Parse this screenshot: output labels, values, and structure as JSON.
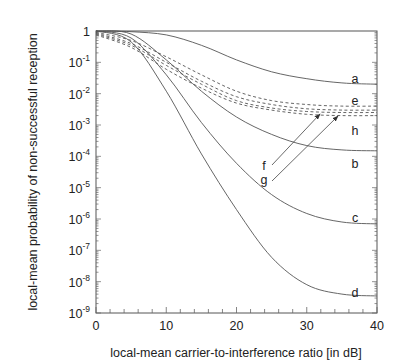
{
  "chart_data": {
    "type": "line",
    "title": "",
    "xlabel": "local-mean carrier-to-interference ratio [in dB]",
    "ylabel": "local-mean probability of non-successful reception",
    "xlim": [
      0,
      40
    ],
    "ylim": [
      1e-09,
      1
    ],
    "yscale": "log",
    "grid": false,
    "legend": "inline curve labels at right",
    "x_ticks": [
      "0",
      "10",
      "20",
      "30",
      "40"
    ],
    "y_ticks": [
      {
        "base": "1",
        "exp": ""
      },
      {
        "base": "10",
        "exp": "-1"
      },
      {
        "base": "10",
        "exp": "-2"
      },
      {
        "base": "10",
        "exp": "-3"
      },
      {
        "base": "10",
        "exp": "-4"
      },
      {
        "base": "10",
        "exp": "-5"
      },
      {
        "base": "10",
        "exp": "-6"
      },
      {
        "base": "10",
        "exp": "-7"
      },
      {
        "base": "10",
        "exp": "-8"
      },
      {
        "base": "10",
        "exp": "-9"
      }
    ],
    "x": [
      0,
      5,
      10,
      15,
      20,
      25,
      30,
      35,
      40
    ],
    "series": [
      {
        "name": "a",
        "style": "solid",
        "values": [
          1.0,
          0.95,
          0.75,
          0.35,
          0.12,
          0.05,
          0.03,
          0.022,
          0.02
        ]
      },
      {
        "name": "e",
        "style": "dashed",
        "values": [
          0.9,
          0.5,
          0.15,
          0.04,
          0.012,
          0.006,
          0.0045,
          0.004,
          0.004
        ]
      },
      {
        "name": "f",
        "style": "dashed",
        "values": [
          0.85,
          0.4,
          0.1,
          0.025,
          0.008,
          0.0045,
          0.0033,
          0.003,
          0.003
        ]
      },
      {
        "name": "g",
        "style": "dashed",
        "values": [
          0.8,
          0.35,
          0.08,
          0.02,
          0.006,
          0.0035,
          0.0027,
          0.0025,
          0.0025
        ]
      },
      {
        "name": "h",
        "style": "dashed",
        "values": [
          0.75,
          0.3,
          0.06,
          0.015,
          0.005,
          0.003,
          0.0022,
          0.002,
          0.002
        ]
      },
      {
        "name": "b",
        "style": "solid",
        "values": [
          1.0,
          0.8,
          0.12,
          0.012,
          0.0018,
          0.0005,
          0.00022,
          0.00016,
          0.00015
        ]
      },
      {
        "name": "c",
        "style": "solid",
        "values": [
          1.0,
          0.6,
          0.04,
          0.0012,
          6e-05,
          6e-06,
          1.5e-06,
          8e-07,
          7e-07
        ]
      },
      {
        "name": "d",
        "style": "solid",
        "values": [
          1.0,
          0.45,
          0.012,
          0.00012,
          2e-06,
          6e-08,
          8e-09,
          4e-09,
          3.5e-09
        ]
      }
    ],
    "annotations": [
      {
        "text": "f",
        "arrow_to_series": "f"
      },
      {
        "text": "g",
        "arrow_to_series": "g"
      }
    ]
  }
}
